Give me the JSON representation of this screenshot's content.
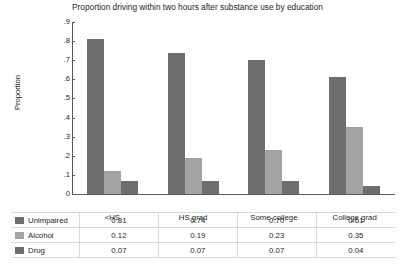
{
  "chart_data": {
    "type": "bar",
    "title": "Proportion driving within two hours after substance use by education",
    "xlabel": "",
    "ylabel": "Proportion",
    "categories": [
      "<HS",
      "HS grad",
      "Some college",
      "College grad"
    ],
    "series": [
      {
        "name": "Unimpaired",
        "color": "#6e6e6e",
        "values": [
          0.81,
          0.74,
          0.7,
          0.61
        ]
      },
      {
        "name": "Alcohol",
        "color": "#a3a3a3",
        "values": [
          0.12,
          0.19,
          0.23,
          0.35
        ]
      },
      {
        "name": "Drug",
        "color": "#6e6e6e",
        "values": [
          0.07,
          0.07,
          0.07,
          0.04
        ]
      }
    ],
    "ylim": [
      0,
      0.9
    ],
    "ytick_labels": [
      "0",
      ".1",
      ".2",
      ".3",
      ".4",
      ".5",
      ".6",
      ".7",
      ".8",
      ".9"
    ],
    "ytick_values": [
      0,
      0.1,
      0.2,
      0.3,
      0.4,
      0.5,
      0.6,
      0.7,
      0.8,
      0.9
    ],
    "grid": false,
    "legend_position": "table-left"
  },
  "table": {
    "column_headers": [
      "<HS",
      "HS grad",
      "Some college",
      "College grad"
    ],
    "rows": [
      {
        "label": "Unimpaired",
        "swatch_color": "#6e6e6e",
        "values": [
          "0.81",
          "0.74",
          "0.70",
          "0.61"
        ]
      },
      {
        "label": "Alcohol",
        "swatch_color": "#a3a3a3",
        "values": [
          "0.12",
          "0.19",
          "0.23",
          "0.35"
        ]
      },
      {
        "label": "Drug",
        "swatch_color": "#6e6e6e",
        "values": [
          "0.07",
          "0.07",
          "0.07",
          "0.04"
        ]
      }
    ]
  },
  "colors": {
    "axis": "#58595b",
    "text": "#231f20",
    "grid_line": "#d9d9d9",
    "background": "#ffffff"
  }
}
